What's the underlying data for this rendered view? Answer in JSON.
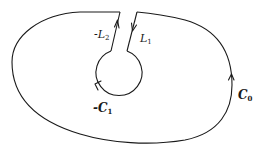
{
  "diagram": {
    "type": "contour-integration-keyhole",
    "stroke_color": "#1a1a1a",
    "background": "#ffffff",
    "curves": [
      {
        "id": "C0",
        "description": "outer closed contour, counterclockwise"
      },
      {
        "id": "-C1",
        "description": "inner small circle, traversed clockwise"
      },
      {
        "id": "L1",
        "description": "right slit segment, directed downward"
      },
      {
        "id": "-L2",
        "description": "left slit segment, directed upward"
      }
    ]
  },
  "labels": {
    "neg_L2": {
      "prefix": "-",
      "base": "L",
      "sub": "2"
    },
    "L1": {
      "prefix": "",
      "base": "L",
      "sub": "1"
    },
    "neg_C1": {
      "prefix": "-",
      "base": "C",
      "sub": "1"
    },
    "C0": {
      "prefix": "",
      "base": "C",
      "sub": "0"
    }
  }
}
